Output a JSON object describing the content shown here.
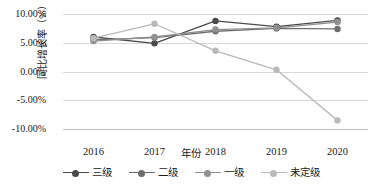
{
  "chart_data": {
    "type": "line",
    "title": "",
    "xlabel": "年份",
    "ylabel": "同比增长率（%）",
    "categories": [
      "2016",
      "2017",
      "2018",
      "2019",
      "2020"
    ],
    "ylim": [
      -10,
      10
    ],
    "ytick_labels": [
      "10.00%",
      "5.00%",
      "0.00%",
      "-5.00%",
      "-10.00%"
    ],
    "ytick_values": [
      10,
      5,
      0,
      -5,
      -10
    ],
    "grid": true,
    "legend_position": "bottom",
    "series": [
      {
        "name": "三级",
        "color": "#4a4a4a",
        "values": [
          6.0,
          4.9,
          8.8,
          7.8,
          8.9
        ]
      },
      {
        "name": "二级",
        "color": "#6e6e6e",
        "values": [
          5.5,
          5.9,
          7.0,
          7.5,
          7.4
        ]
      },
      {
        "name": "一级",
        "color": "#909090",
        "values": [
          5.3,
          6.0,
          7.3,
          7.6,
          8.6
        ]
      },
      {
        "name": "未定级",
        "color": "#b9b9b9",
        "values": [
          5.8,
          8.3,
          3.6,
          0.3,
          -8.5
        ]
      }
    ]
  },
  "colors": {
    "gridline": "#d9d9d9",
    "axis": "#bfbfbf",
    "text": "#1a1a1a",
    "background": "#ffffff"
  }
}
